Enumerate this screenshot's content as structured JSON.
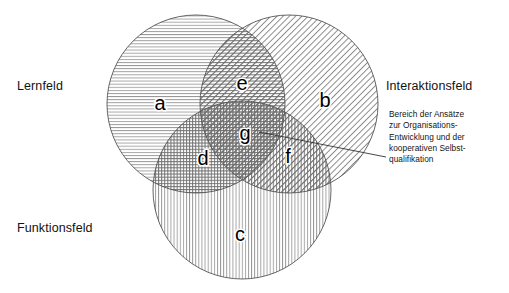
{
  "diagram": {
    "type": "venn-3-circle",
    "title_labels": {
      "left_top": "Lernfeld",
      "right_top": "Interaktionsfeld",
      "left_bottom": "Funktionsfeld"
    },
    "sets": [
      {
        "id": "lernfeld",
        "label": "Lernfeld",
        "letter": "a",
        "hatch": "horizontal",
        "cx": 196,
        "cy": 104,
        "r": 89
      },
      {
        "id": "interaktionsfeld",
        "label": "Interaktionsfeld",
        "letter": "b",
        "hatch": "diagonal",
        "cx": 289,
        "cy": 104,
        "r": 89
      },
      {
        "id": "funktionsfeld",
        "label": "Funktionsfeld",
        "letter": "c",
        "hatch": "vertical",
        "cx": 242,
        "cy": 190,
        "r": 89
      }
    ],
    "regions": [
      {
        "id": "region-a",
        "letter": "a",
        "members": [
          "lernfeld"
        ],
        "x": 160,
        "y": 103
      },
      {
        "id": "region-b",
        "letter": "b",
        "members": [
          "interaktionsfeld"
        ],
        "x": 325,
        "y": 100
      },
      {
        "id": "region-c",
        "letter": "c",
        "members": [
          "funktionsfeld"
        ],
        "x": 240,
        "y": 234
      },
      {
        "id": "region-d",
        "letter": "d",
        "members": [
          "lernfeld",
          "funktionsfeld"
        ],
        "x": 203,
        "y": 158
      },
      {
        "id": "region-e",
        "letter": "e",
        "members": [
          "lernfeld",
          "interaktionsfeld"
        ],
        "x": 242,
        "y": 83
      },
      {
        "id": "region-f",
        "letter": "f",
        "members": [
          "interaktionsfeld",
          "funktionsfeld"
        ],
        "x": 288,
        "y": 156
      },
      {
        "id": "region-g",
        "letter": "g",
        "members": [
          "lernfeld",
          "interaktionsfeld",
          "funktionsfeld"
        ],
        "x": 245,
        "y": 133
      }
    ],
    "annotation": {
      "target_region": "g",
      "lines": [
        "Bereich der Ansätze",
        "zur Organisations-",
        "Entwicklung und der",
        "kooperativen Selbst-",
        "qualifikation"
      ],
      "leader_line": {
        "x1": 259,
        "y1": 132,
        "x2": 386,
        "y2": 157
      }
    },
    "colors": {
      "stroke": "#555555",
      "hatch": "#666666",
      "text": "#121212",
      "background": "#ffffff"
    }
  }
}
